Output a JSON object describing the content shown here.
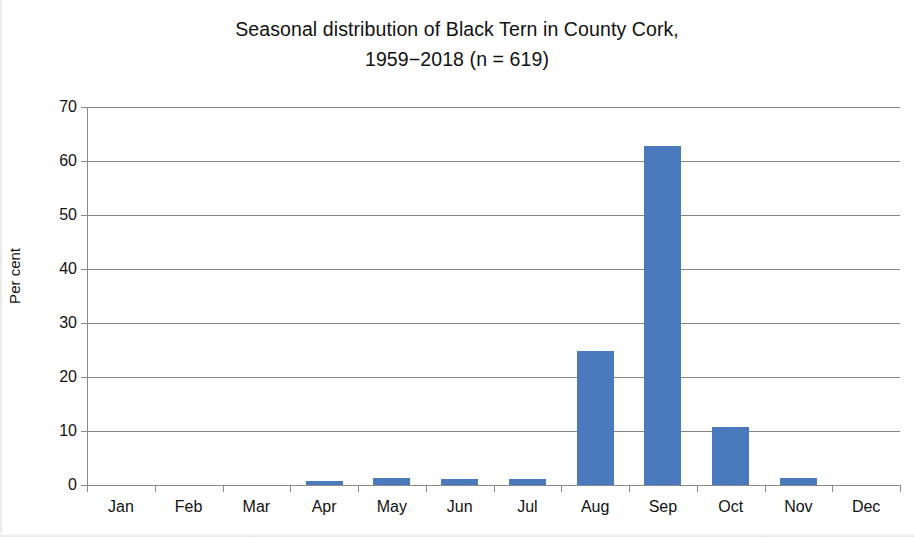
{
  "chart_data": {
    "type": "bar",
    "title": "Seasonal distribution of Black Tern in County Cork,",
    "title_line2": "1959−2018 (n = 619)",
    "title_full": "Seasonal distribution of Black Tern in County Cork, 1959−2018 (n = 619)",
    "xlabel": "",
    "ylabel": "Per cent",
    "categories": [
      "Jan",
      "Feb",
      "Mar",
      "Apr",
      "May",
      "Jun",
      "Jul",
      "Aug",
      "Sep",
      "Oct",
      "Nov",
      "Dec"
    ],
    "values": [
      0,
      0,
      0,
      0.8,
      1.3,
      1.1,
      1.1,
      24.8,
      62.8,
      10.7,
      1.3,
      0
    ],
    "ylim": [
      0,
      70
    ],
    "ytick_values": [
      0,
      10,
      20,
      30,
      40,
      50,
      60,
      70
    ],
    "ytick_labels": [
      "0",
      "10",
      "20",
      "30",
      "40",
      "50",
      "60",
      "70"
    ],
    "grid": true,
    "grid_axis": "y",
    "legend": false,
    "legend_position": "none",
    "bar_color": "#4a79bd",
    "series": [
      {
        "name": "Per cent",
        "values": [
          0,
          0,
          0,
          0.8,
          1.3,
          1.1,
          1.1,
          24.8,
          62.8,
          10.7,
          1.3,
          0
        ]
      }
    ]
  },
  "colors": {
    "bar": "#4a79bd",
    "gridline": "#868686",
    "axis": "#8a8a8a",
    "text": "#111111",
    "background": "#ffffff"
  }
}
